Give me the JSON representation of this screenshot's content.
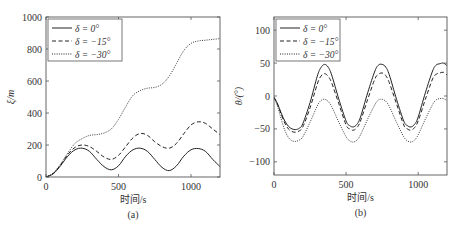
{
  "chart_data": [
    {
      "id": "a",
      "type": "line",
      "caption": "(a)",
      "title": "",
      "xlabel": "时间/s",
      "ylabel": "ξ/m",
      "xlim": [
        0,
        1200
      ],
      "ylim": [
        0,
        1000
      ],
      "xticks": [
        0,
        500,
        1000
      ],
      "yticks": [
        0,
        200,
        400,
        600,
        800,
        1000
      ],
      "grid": false,
      "legend_position": "upper left",
      "x": [
        0,
        50,
        100,
        150,
        200,
        250,
        300,
        350,
        400,
        450,
        500,
        550,
        600,
        650,
        700,
        750,
        800,
        850,
        900,
        950,
        1000,
        1050,
        1100,
        1150,
        1200
      ],
      "series": [
        {
          "name": "δ = 0°",
          "style": "solid",
          "values": [
            0,
            20,
            70,
            130,
            170,
            180,
            160,
            110,
            65,
            45,
            70,
            130,
            170,
            180,
            160,
            110,
            60,
            40,
            70,
            130,
            170,
            178,
            160,
            110,
            65
          ]
        },
        {
          "name": "δ = −15°",
          "style": "dashed",
          "values": [
            0,
            22,
            75,
            140,
            185,
            200,
            190,
            160,
            125,
            110,
            135,
            190,
            245,
            272,
            260,
            220,
            190,
            180,
            210,
            270,
            325,
            345,
            335,
            300,
            265
          ]
        },
        {
          "name": "δ = −30°",
          "style": "dotted",
          "values": [
            0,
            25,
            80,
            150,
            210,
            240,
            260,
            265,
            275,
            300,
            360,
            440,
            510,
            540,
            555,
            560,
            580,
            630,
            710,
            790,
            835,
            850,
            855,
            860,
            865
          ]
        }
      ]
    },
    {
      "id": "b",
      "type": "line",
      "caption": "(b)",
      "title": "",
      "xlabel": "时间/s",
      "ylabel": "θ/(°)",
      "xlim": [
        0,
        1200
      ],
      "ylim": [
        -120,
        120
      ],
      "xticks": [
        0,
        500,
        1000
      ],
      "yticks": [
        -100,
        -50,
        0,
        50,
        100
      ],
      "grid": false,
      "legend_position": "upper left",
      "x": [
        0,
        25,
        50,
        75,
        100,
        125,
        150,
        175,
        200,
        250,
        300,
        325,
        350,
        375,
        400,
        450,
        500,
        525,
        550,
        575,
        600,
        650,
        700,
        725,
        750,
        775,
        800,
        850,
        900,
        925,
        950,
        975,
        1000,
        1050,
        1100,
        1125,
        1150,
        1175,
        1200
      ],
      "series": [
        {
          "name": "δ = 0°",
          "style": "solid",
          "values": [
            -2,
            -12,
            -26,
            -38,
            -46,
            -50,
            -51,
            -49,
            -42,
            -10,
            30,
            43,
            48,
            44,
            32,
            -5,
            -38,
            -45,
            -47,
            -43,
            -32,
            5,
            38,
            47,
            48,
            44,
            32,
            -5,
            -38,
            -45,
            -47,
            -43,
            -32,
            5,
            38,
            47,
            49,
            50,
            46
          ]
        },
        {
          "name": "δ = −15°",
          "style": "dashed",
          "values": [
            -2,
            -13,
            -28,
            -41,
            -50,
            -54,
            -55,
            -53,
            -47,
            -18,
            18,
            30,
            34,
            30,
            20,
            -12,
            -44,
            -50,
            -52,
            -48,
            -38,
            -5,
            26,
            33,
            35,
            31,
            20,
            -12,
            -44,
            -50,
            -52,
            -48,
            -38,
            -5,
            26,
            33,
            35,
            36,
            32
          ]
        },
        {
          "name": "δ = −30°",
          "style": "dotted",
          "values": [
            -2,
            -16,
            -35,
            -52,
            -63,
            -68,
            -69,
            -67,
            -62,
            -40,
            -15,
            -7,
            -5,
            -8,
            -16,
            -40,
            -62,
            -68,
            -70,
            -67,
            -59,
            -35,
            -13,
            -6,
            -5,
            -8,
            -16,
            -40,
            -62,
            -68,
            -70,
            -67,
            -59,
            -35,
            -13,
            -6,
            -4,
            -4,
            -7
          ]
        }
      ]
    }
  ]
}
